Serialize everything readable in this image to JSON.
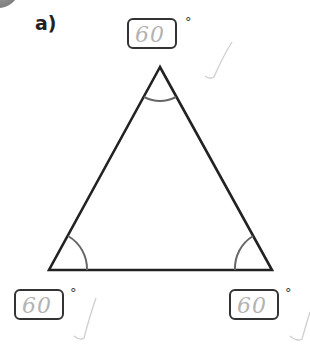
{
  "question": {
    "label": "a)",
    "shape": "equilateral triangle",
    "angles": [
      {
        "position": "top",
        "answer": "60",
        "unit": "°",
        "marked": "correct"
      },
      {
        "position": "bottom-left",
        "answer": "60",
        "unit": "°",
        "marked": "correct"
      },
      {
        "position": "bottom-right",
        "answer": "60",
        "unit": "°",
        "marked": "correct"
      }
    ]
  },
  "colors": {
    "outline": "#222222",
    "arc": "#666666",
    "handwriting": "#b3b3b3",
    "tick": "#cccccc"
  }
}
